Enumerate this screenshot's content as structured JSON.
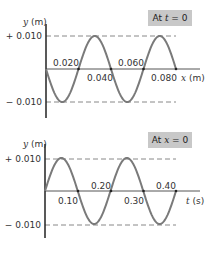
{
  "chart_data": [
    {
      "type": "line",
      "title": "At t = 0",
      "xlabel": "x (m)",
      "ylabel": "y (m)",
      "y_ticks": [
        "+ 0.010",
        "- 0.010"
      ],
      "x_ticks": [
        "0.020",
        "0.040",
        "0.060",
        "0.080"
      ],
      "amplitude": 0.01,
      "wavelength": 0.04,
      "x_range": [
        0,
        0.08
      ],
      "function": "y = -0.010 sin(2*pi*x/0.040)",
      "grid": false
    },
    {
      "type": "line",
      "title": "At x = 0",
      "xlabel": "t (s)",
      "ylabel": "y (m)",
      "y_ticks": [
        "+ 0.010",
        "- 0.010"
      ],
      "x_ticks": [
        "0.10",
        "0.20",
        "0.30",
        "0.40"
      ],
      "amplitude": 0.01,
      "period": 0.2,
      "x_range": [
        0,
        0.4
      ],
      "function": "y = 0.010 sin(2*pi*t/0.20)",
      "grid": false
    }
  ],
  "top": {
    "badge_prefix": "At ",
    "badge_var": "t",
    "badge_suffix": " = 0",
    "ylabel_var": "y",
    "ylabel_unit": " (m)",
    "ytick_pos": "+ 0.010",
    "ytick_neg": "− 0.010",
    "xticks": [
      "0.020",
      "0.040",
      "0.060",
      "0.080"
    ],
    "xlabel_var": "x",
    "xlabel_unit": " (m)"
  },
  "bottom": {
    "badge_prefix": "At ",
    "badge_var": "x",
    "badge_suffix": " = 0",
    "ylabel_var": "y",
    "ylabel_unit": " (m)",
    "ytick_pos": "+ 0.010",
    "ytick_neg": "− 0.010",
    "xticks": [
      "0.10",
      "0.20",
      "0.30",
      "0.40"
    ],
    "xlabel_var": "t",
    "xlabel_unit": " (s)"
  },
  "colors": {
    "wave": "#7a7a7a",
    "axis": "#222222",
    "dash": "#888888",
    "badge": "#c8c8c8"
  }
}
